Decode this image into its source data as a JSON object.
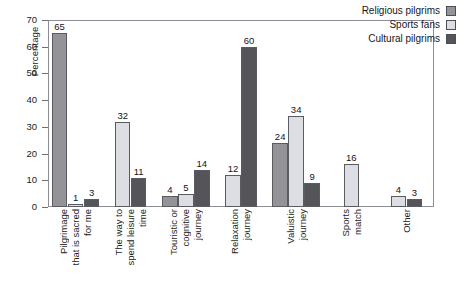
{
  "chart_data": {
    "type": "bar",
    "title": "",
    "subtitle": "",
    "xlabel": "",
    "ylabel": "Percentage",
    "ylim": [
      0,
      70
    ],
    "yticks": [
      0,
      10,
      20,
      30,
      40,
      50,
      60,
      70
    ],
    "ytick_labels": [
      "0",
      "10",
      "20",
      "30",
      "40",
      "50",
      "60",
      "70"
    ],
    "grid": false,
    "legend_position": "top-right",
    "categories": [
      "Pilgrimage that is sacred for me",
      "The way to spend leisure time",
      "Touristic or cognitive journey",
      "Relaxation journey",
      "Valuistic journey",
      "Sports match",
      "Other"
    ],
    "category_lines": [
      [
        "Pilgrimage",
        "that is sacred",
        "for me"
      ],
      [
        "The way to",
        "spend leisure",
        "time"
      ],
      [
        "Touristic or",
        "cognitive",
        "journey"
      ],
      [
        "Relaxation",
        "journey"
      ],
      [
        "Valuistic",
        "journey"
      ],
      [
        "Sports",
        "match"
      ],
      [
        "Other"
      ]
    ],
    "series": [
      {
        "name": "Religious pilgrims",
        "color": "#939398",
        "values": [
          65,
          null,
          4,
          null,
          24,
          null,
          null
        ]
      },
      {
        "name": "Sports fans",
        "color": "#dcdee3",
        "values": [
          1,
          32,
          5,
          12,
          34,
          16,
          4
        ]
      },
      {
        "name": "Cultural pilgrims",
        "color": "#545459",
        "values": [
          3,
          11,
          14,
          60,
          9,
          null,
          3
        ]
      }
    ],
    "data_labels": [
      [
        "65",
        "1",
        "3"
      ],
      [
        "",
        "32",
        "11"
      ],
      [
        "4",
        "5",
        "14"
      ],
      [
        "",
        "12",
        "60"
      ],
      [
        "24",
        "34",
        "9"
      ],
      [
        "",
        "16",
        ""
      ],
      [
        "",
        "4",
        "3"
      ]
    ],
    "axis_color": "#8d8d95",
    "bar_edge_color": "#5a5a62",
    "background": "#ffffff"
  },
  "legend": {
    "items": [
      {
        "label": "Religious pilgrims",
        "color": "#939398"
      },
      {
        "label": "Sports fans",
        "color": "#dcdee3"
      },
      {
        "label": "Cultural pilgrims",
        "color": "#545459"
      }
    ]
  }
}
